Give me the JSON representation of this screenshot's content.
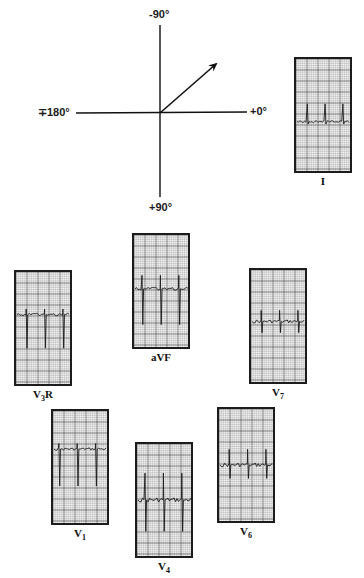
{
  "axis_diagram": {
    "origin": [
      160,
      113
    ],
    "labels": {
      "top": "-90°",
      "bottom": "+90°",
      "left": "∓180°",
      "right": "+0°"
    },
    "vector": {
      "from": [
        160,
        113
      ],
      "to": [
        217,
        63
      ],
      "description": "mean QRS axis arrow pointing toward approx -40°"
    }
  },
  "leads": [
    {
      "id": "I",
      "label": "I",
      "sub": "",
      "suffix": "",
      "box": [
        294,
        57
      ],
      "baseline": 0.56,
      "beats": [
        0.22,
        0.55,
        0.88
      ],
      "r": 0.16,
      "s": 0.02,
      "noise": 0.01
    },
    {
      "id": "aVF",
      "label": "aVF",
      "sub": "",
      "suffix": "",
      "box": [
        132,
        233
      ],
      "baseline": 0.48,
      "beats": [
        0.16,
        0.5,
        0.84
      ],
      "r": 0.12,
      "s": 0.32,
      "noise": 0.015
    },
    {
      "id": "V3R",
      "label": "V",
      "sub": "3",
      "suffix": "R",
      "box": [
        14,
        270
      ],
      "baseline": 0.38,
      "beats": [
        0.2,
        0.54,
        0.88
      ],
      "r": 0.05,
      "s": 0.3,
      "noise": 0.012
    },
    {
      "id": "V7",
      "label": "V",
      "sub": "7",
      "suffix": "",
      "box": [
        249,
        268
      ],
      "baseline": 0.46,
      "beats": [
        0.2,
        0.54,
        0.88
      ],
      "r": 0.1,
      "s": 0.1,
      "noise": 0.015
    },
    {
      "id": "V1",
      "label": "V",
      "sub": "1",
      "suffix": "",
      "box": [
        51,
        409
      ],
      "baseline": 0.34,
      "beats": [
        0.12,
        0.46,
        0.8
      ],
      "r": 0.05,
      "s": 0.33,
      "noise": 0.012
    },
    {
      "id": "V4",
      "label": "V",
      "sub": "4",
      "suffix": "",
      "box": [
        135,
        442
      ],
      "baseline": 0.5,
      "beats": [
        0.16,
        0.5,
        0.84
      ],
      "r": 0.24,
      "s": 0.28,
      "noise": 0.02
    },
    {
      "id": "V6",
      "label": "V",
      "sub": "6",
      "suffix": "",
      "box": [
        217,
        407
      ],
      "baseline": 0.5,
      "beats": [
        0.2,
        0.54,
        0.88
      ],
      "r": 0.14,
      "s": 0.12,
      "noise": 0.018
    }
  ],
  "colors": {
    "grid_minor": "#9a9a9a",
    "grid_major": "#4a4a4a",
    "paper": "#f4f4f4",
    "trace": "#1a1a1a",
    "border": "#1c1c1c"
  }
}
